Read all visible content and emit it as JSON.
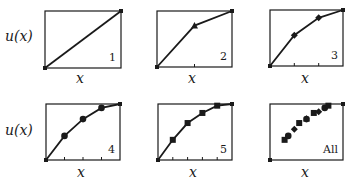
{
  "figure": {
    "ylabel": "u(x)",
    "xlabel": "x"
  },
  "chart_data": [
    {
      "type": "line",
      "panel": "1",
      "marker": "none",
      "frame": [
        45,
        11,
        121,
        68
      ],
      "ticks": [],
      "points": [
        [
          0,
          0
        ],
        [
          1,
          1
        ]
      ]
    },
    {
      "type": "line",
      "panel": "2",
      "marker": "triangle",
      "frame": [
        157,
        11,
        232,
        67
      ],
      "ticks": [
        0.5
      ],
      "points": [
        [
          0,
          0
        ],
        [
          0.5,
          0.74
        ],
        [
          1,
          1
        ]
      ]
    },
    {
      "type": "line",
      "panel": "3",
      "marker": "diamond",
      "frame": [
        270,
        10,
        343,
        66
      ],
      "ticks": [
        0.333,
        0.667
      ],
      "points": [
        [
          0,
          0
        ],
        [
          0.333,
          0.55
        ],
        [
          0.667,
          0.86
        ],
        [
          1,
          1
        ]
      ]
    },
    {
      "type": "line",
      "panel": "4",
      "marker": "circle",
      "frame": [
        46,
        104,
        120,
        160
      ],
      "ticks": [
        0.25,
        0.5,
        0.75
      ],
      "points": [
        [
          0,
          0
        ],
        [
          0.25,
          0.43
        ],
        [
          0.5,
          0.73
        ],
        [
          0.75,
          0.93
        ],
        [
          1,
          1
        ]
      ]
    },
    {
      "type": "line",
      "panel": "5",
      "marker": "square",
      "frame": [
        158,
        104,
        232,
        160
      ],
      "ticks": [
        0.2,
        0.4,
        0.6,
        0.8
      ],
      "points": [
        [
          0,
          0
        ],
        [
          0.2,
          0.36
        ],
        [
          0.4,
          0.66
        ],
        [
          0.6,
          0.84
        ],
        [
          0.8,
          0.97
        ],
        [
          1,
          1
        ]
      ]
    },
    {
      "type": "scatter",
      "panel": "All",
      "marker": "mixed",
      "frame": [
        270,
        104,
        343,
        160
      ],
      "ticks": [],
      "points": [
        [
          0,
          0
        ],
        [
          0.2,
          0.36
        ],
        [
          0.25,
          0.43
        ],
        [
          0.333,
          0.55
        ],
        [
          0.4,
          0.66
        ],
        [
          0.5,
          0.73
        ],
        [
          0.5,
          0.74
        ],
        [
          0.6,
          0.84
        ],
        [
          0.667,
          0.86
        ],
        [
          0.75,
          0.93
        ],
        [
          0.8,
          0.97
        ],
        [
          1,
          1
        ]
      ]
    }
  ],
  "panels": [
    {
      "label": "1"
    },
    {
      "label": "2"
    },
    {
      "label": "3"
    },
    {
      "label": "4"
    },
    {
      "label": "5"
    },
    {
      "label": "All"
    }
  ]
}
